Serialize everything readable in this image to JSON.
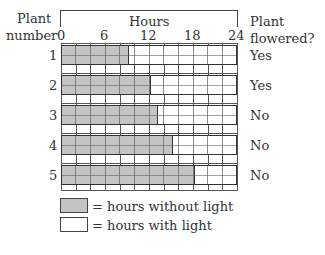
{
  "chart_data": {
    "type": "bar",
    "orientation": "horizontal-stacked",
    "title": "Hours",
    "xlabel": "Hours",
    "ylabel": "Plant number",
    "right_label": "Plant flowered?",
    "xlim": [
      0,
      24
    ],
    "x_ticks": [
      0,
      6,
      12,
      18,
      24
    ],
    "grid_step": 2,
    "categories": [
      "1",
      "2",
      "3",
      "4",
      "5"
    ],
    "series": [
      {
        "name": "hours without light",
        "color": "#c4c4c4",
        "values": [
          9,
          12,
          13,
          15,
          18
        ]
      },
      {
        "name": "hours with light",
        "color": "#ffffff",
        "values": [
          15,
          12,
          11,
          9,
          6
        ]
      }
    ],
    "flowered": [
      "Yes",
      "Yes",
      "No",
      "No",
      "No"
    ],
    "legend": [
      {
        "label": "= hours without light",
        "color": "#c4c4c4"
      },
      {
        "label": "= hours with light",
        "color": "#ffffff"
      }
    ]
  },
  "labels": {
    "plant": "Plant",
    "number": "number",
    "hours": "Hours",
    "plant2": "Plant",
    "flowered": "flowered?",
    "t0": "0",
    "t6": "6",
    "t12": "12",
    "t18": "18",
    "t24": "24",
    "rows": [
      "1",
      "2",
      "3",
      "4",
      "5"
    ],
    "answers": [
      "Yes",
      "Yes",
      "No",
      "No",
      "No"
    ],
    "legend_dark": "= hours without light",
    "legend_light": "= hours with light"
  }
}
